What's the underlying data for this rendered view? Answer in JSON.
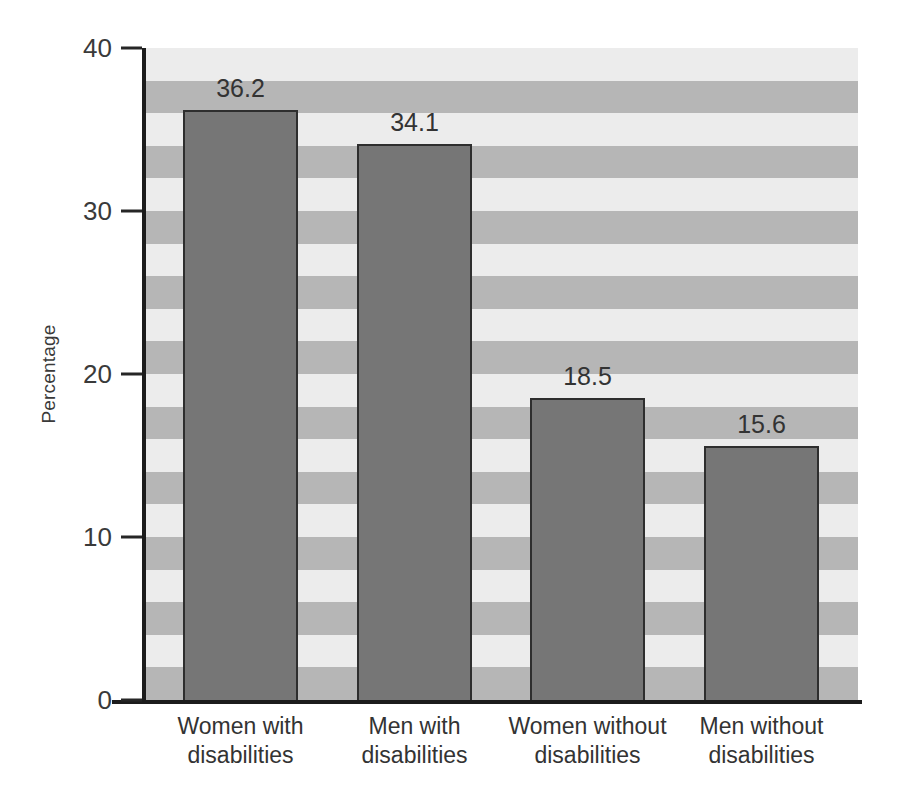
{
  "chart_data": {
    "type": "bar",
    "title": "",
    "subtitle": "",
    "xlabel": "",
    "ylabel": "Percentage",
    "categories": [
      "Women with disabilities",
      "Men with disabilities",
      "Women without disabilities",
      "Men without disabilities"
    ],
    "category_lines": [
      [
        "Women with",
        "disabilities"
      ],
      [
        "Men with",
        "disabilities"
      ],
      [
        "Women without",
        "disabilities"
      ],
      [
        "Men without",
        "disabilities"
      ]
    ],
    "values": [
      36.2,
      34.1,
      18.5,
      15.6
    ],
    "value_labels": [
      "36.2",
      "34.1",
      "18.5",
      "15.6"
    ],
    "ylim": [
      0,
      40
    ],
    "yticks": [
      0,
      10,
      20,
      30,
      40
    ],
    "ytick_labels": [
      "0",
      "10",
      "20",
      "30",
      "40"
    ],
    "grid": false,
    "background_banding": true,
    "band_unit": 2,
    "legend": null,
    "legend_position": "none",
    "colors": {
      "bar_fill": "#767676",
      "bar_edge": "#2e2e2e",
      "band_light": "#ececec",
      "band_dark": "#b6b6b6",
      "axis": "#1c1c1c",
      "text": "#333333"
    }
  }
}
